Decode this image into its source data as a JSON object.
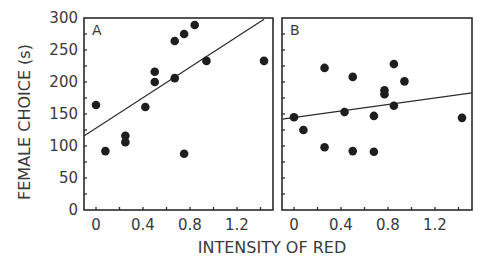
{
  "chart_data": {
    "type": "scatter",
    "ylabel": "FEMALE CHOICE (s)",
    "xlabel": "INTENSITY OF RED",
    "ylim": [
      0,
      300
    ],
    "xlim": [
      -0.1,
      1.5
    ],
    "yticks": [
      0,
      50,
      100,
      150,
      200,
      250,
      300
    ],
    "xticks": [
      0,
      0.4,
      0.8,
      1.2
    ],
    "xtick_labels": [
      "0",
      "0.4",
      "0.8",
      "1.2"
    ],
    "ytick_labels": [
      "0",
      "50",
      "100",
      "150",
      "200",
      "250",
      "300"
    ],
    "grid": false,
    "legend": null,
    "panels": [
      {
        "label": "A",
        "points": [
          {
            "x": 0.0,
            "y": 164
          },
          {
            "x": 0.08,
            "y": 92
          },
          {
            "x": 0.25,
            "y": 116
          },
          {
            "x": 0.25,
            "y": 106
          },
          {
            "x": 0.42,
            "y": 161
          },
          {
            "x": 0.5,
            "y": 216
          },
          {
            "x": 0.5,
            "y": 200
          },
          {
            "x": 0.67,
            "y": 264
          },
          {
            "x": 0.67,
            "y": 206
          },
          {
            "x": 0.75,
            "y": 275
          },
          {
            "x": 0.75,
            "y": 88
          },
          {
            "x": 0.84,
            "y": 289
          },
          {
            "x": 0.94,
            "y": 233
          },
          {
            "x": 1.43,
            "y": 233
          }
        ],
        "fit_line": {
          "x1": -0.1,
          "y1": 116,
          "x2": 1.43,
          "y2": 298
        }
      },
      {
        "label": "B",
        "points": [
          {
            "x": 0.0,
            "y": 145
          },
          {
            "x": 0.08,
            "y": 125
          },
          {
            "x": 0.26,
            "y": 222
          },
          {
            "x": 0.26,
            "y": 98
          },
          {
            "x": 0.43,
            "y": 153
          },
          {
            "x": 0.5,
            "y": 208
          },
          {
            "x": 0.5,
            "y": 92
          },
          {
            "x": 0.68,
            "y": 147
          },
          {
            "x": 0.68,
            "y": 91
          },
          {
            "x": 0.77,
            "y": 187
          },
          {
            "x": 0.77,
            "y": 181
          },
          {
            "x": 0.85,
            "y": 228
          },
          {
            "x": 0.85,
            "y": 163
          },
          {
            "x": 0.94,
            "y": 201
          },
          {
            "x": 1.43,
            "y": 144
          }
        ],
        "fit_line": {
          "x1": -0.1,
          "y1": 142,
          "x2": 1.52,
          "y2": 183
        }
      }
    ]
  }
}
